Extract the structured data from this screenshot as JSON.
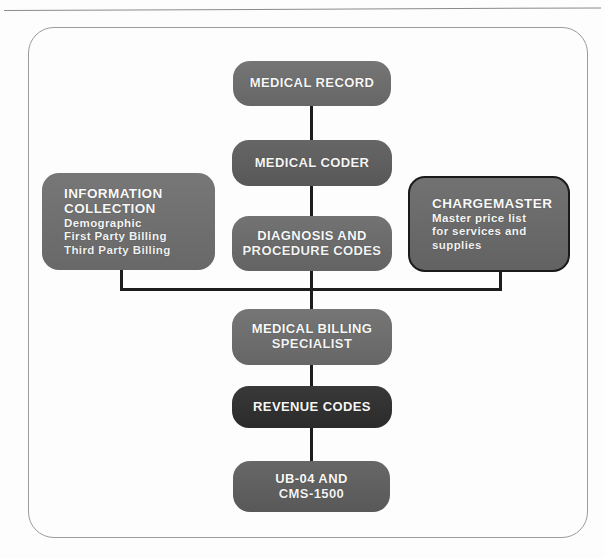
{
  "page": {
    "background": "#fdfdfd",
    "frame_color": "#9b9b9b",
    "connector_color": "#1d1d1d"
  },
  "diagram": {
    "nodes": {
      "medical_record": {
        "label": "MEDICAL RECORD",
        "fill": "#6e6e6e"
      },
      "medical_coder": {
        "label": "MEDICAL CODER",
        "fill": "#5e5e5e"
      },
      "information_collection": {
        "label": "INFORMATION\nCOLLECTION",
        "detail": "Demographic\nFirst Party Billing\nThird Party Billing",
        "fill": "#707070"
      },
      "diagnosis_procedure_codes": {
        "label": "DIAGNOSIS AND\nPROCEDURE CODES",
        "fill": "#6b6b6b"
      },
      "chargemaster": {
        "label": "CHARGEMASTER",
        "detail": "Master price list\nfor services and\nsupplies",
        "fill": "#6a6a6a",
        "border": "#1a1a1a"
      },
      "medical_billing_specialist": {
        "label": "MEDICAL BILLING\nSPECIALIST",
        "fill": "#6e6e6e"
      },
      "revenue_codes": {
        "label": "REVENUE CODES",
        "fill": "#2e2e2e"
      },
      "ub04_cms1500": {
        "label": "UB-04 AND\nCMS-1500",
        "fill": "#5f5f5f"
      }
    }
  }
}
